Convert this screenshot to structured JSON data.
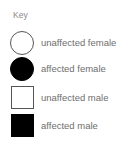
{
  "key": {
    "title": "Key",
    "items": [
      {
        "symbol": "circle-outline-icon",
        "label": "unaffected female"
      },
      {
        "symbol": "circle-filled-icon",
        "label": "affected female"
      },
      {
        "symbol": "square-outline-icon",
        "label": "unaffected male"
      },
      {
        "symbol": "square-filled-icon",
        "label": "affected male"
      }
    ]
  },
  "colors": {
    "affected": "#000000",
    "unaffected_fill": "#ffffff",
    "outline": "#555555",
    "text": "#6e6e6e"
  }
}
